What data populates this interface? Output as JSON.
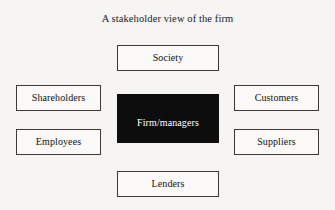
{
  "diagram": {
    "title": "A stakeholder view of the firm",
    "center": {
      "label": "Firm/managers",
      "fill": "#0d0d0d",
      "text_color": "#ffffff"
    },
    "stakeholders": [
      {
        "id": "society",
        "label": "Society",
        "position": "top"
      },
      {
        "id": "shareholders",
        "label": "Shareholders",
        "position": "left-upper"
      },
      {
        "id": "customers",
        "label": "Customers",
        "position": "right-upper"
      },
      {
        "id": "employees",
        "label": "Employees",
        "position": "left-lower"
      },
      {
        "id": "suppliers",
        "label": "Suppliers",
        "position": "right-lower"
      },
      {
        "id": "lenders",
        "label": "Lenders",
        "position": "bottom"
      }
    ],
    "style": {
      "background": "#f6f5f3",
      "box_fill": "#fbfaf9",
      "box_border": "#3a3a3a",
      "text_color": "#111111"
    }
  }
}
